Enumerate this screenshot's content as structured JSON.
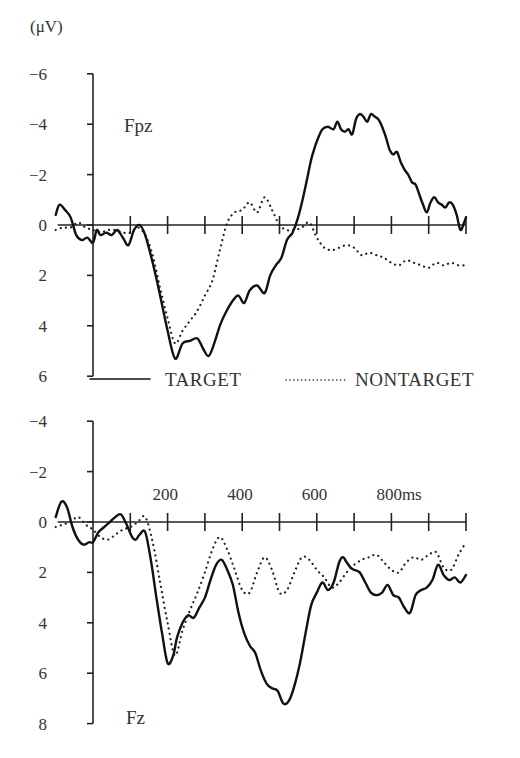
{
  "chart_data": [
    {
      "type": "line",
      "panel": "top",
      "unit_label": "(μV)",
      "channel": "Fpz",
      "xlabel": "",
      "ylabel": "(μV)",
      "x_unit": "ms",
      "xlim": [
        -100,
        1000
      ],
      "ylim": [
        -6,
        6
      ],
      "y_inverted": true,
      "yticks": [
        -6,
        -4,
        -2,
        0,
        2,
        4,
        6
      ],
      "ytick_labels": [
        "−6",
        "−4",
        "−2",
        "0",
        "2",
        "4",
        "6"
      ],
      "xticks": [
        0,
        100,
        200,
        300,
        400,
        500,
        600,
        700,
        800,
        900,
        1000
      ],
      "xtick_labels": [],
      "grid": false,
      "legend": "between-panels",
      "series": [
        {
          "name": "TARGET",
          "style": "solid",
          "x": [
            -100,
            -90,
            -75,
            -60,
            -45,
            -30,
            -15,
            0,
            10,
            20,
            35,
            50,
            65,
            80,
            95,
            110,
            125,
            140,
            160,
            180,
            200,
            220,
            240,
            260,
            280,
            295,
            310,
            325,
            340,
            355,
            375,
            390,
            405,
            420,
            440,
            460,
            475,
            490,
            505,
            520,
            535,
            550,
            565,
            575,
            585,
            595,
            605,
            615,
            630,
            645,
            655,
            665,
            675,
            685,
            695,
            705,
            715,
            725,
            735,
            745,
            755,
            765,
            775,
            785,
            795,
            805,
            815,
            825,
            835,
            845,
            855,
            865,
            875,
            885,
            895,
            905,
            915,
            925,
            935,
            945,
            955,
            965,
            975,
            985,
            995,
            1000
          ],
          "y": [
            -0.4,
            -0.8,
            -0.6,
            -0.3,
            0.4,
            0.6,
            0.5,
            0.7,
            0.2,
            0.4,
            0.3,
            0.4,
            0.2,
            0.5,
            0.8,
            0.2,
            0.0,
            0.4,
            1.5,
            2.8,
            4.2,
            5.3,
            4.7,
            4.6,
            4.5,
            4.9,
            5.2,
            4.7,
            4.0,
            3.5,
            3.0,
            2.8,
            3.1,
            2.6,
            2.4,
            2.7,
            2.0,
            1.6,
            1.3,
            0.6,
            0.3,
            -0.3,
            -1.2,
            -1.9,
            -2.6,
            -3.1,
            -3.5,
            -3.8,
            -3.9,
            -3.8,
            -4.1,
            -3.8,
            -3.7,
            -3.8,
            -3.6,
            -4.2,
            -4.4,
            -4.3,
            -4.1,
            -4.4,
            -4.3,
            -4.2,
            -3.9,
            -3.5,
            -3.0,
            -2.8,
            -2.9,
            -2.5,
            -2.2,
            -2.0,
            -1.7,
            -1.6,
            -1.2,
            -0.8,
            -0.5,
            -0.9,
            -1.1,
            -0.9,
            -0.8,
            -0.7,
            -0.9,
            -0.8,
            -0.4,
            0.2,
            -0.1,
            -0.3
          ]
        },
        {
          "name": "NONTARGET",
          "style": "dotted",
          "x": [
            -100,
            -80,
            -60,
            -40,
            -20,
            0,
            20,
            40,
            60,
            80,
            100,
            120,
            140,
            160,
            180,
            200,
            220,
            240,
            260,
            280,
            300,
            320,
            340,
            360,
            380,
            400,
            420,
            440,
            460,
            480,
            500,
            520,
            540,
            560,
            580,
            600,
            620,
            640,
            660,
            680,
            700,
            720,
            740,
            760,
            780,
            800,
            820,
            840,
            860,
            880,
            900,
            920,
            940,
            960,
            980,
            1000
          ],
          "y": [
            0.2,
            0.1,
            0.1,
            -0.1,
            0.1,
            0.2,
            0.3,
            0.2,
            0.2,
            0.3,
            0.3,
            0.1,
            0.4,
            1.2,
            2.5,
            3.7,
            4.7,
            4.2,
            3.8,
            3.4,
            2.8,
            2.2,
            1.0,
            -0.1,
            -0.5,
            -0.6,
            -0.9,
            -0.5,
            -1.1,
            -0.6,
            0.0,
            0.2,
            0.2,
            0.1,
            -0.1,
            0.5,
            0.9,
            1.0,
            0.9,
            0.8,
            0.9,
            1.2,
            1.1,
            1.2,
            1.3,
            1.5,
            1.6,
            1.4,
            1.5,
            1.6,
            1.7,
            1.5,
            1.6,
            1.5,
            1.6,
            1.6
          ]
        }
      ]
    },
    {
      "type": "line",
      "panel": "bottom",
      "channel": "Fz",
      "xlabel": "",
      "ylabel": "",
      "x_unit": "ms",
      "xlim": [
        -100,
        1000
      ],
      "ylim": [
        -4,
        8
      ],
      "y_inverted": true,
      "yticks": [
        -4,
        -2,
        0,
        2,
        4,
        6,
        8
      ],
      "ytick_labels": [
        "−4",
        "−2",
        "0",
        "2",
        "4",
        "6",
        "8"
      ],
      "xticks": [
        0,
        100,
        200,
        300,
        400,
        500,
        600,
        700,
        800,
        900,
        1000
      ],
      "xtick_labels": [
        "200",
        "400",
        "600",
        "800ms"
      ],
      "xtick_label_values": [
        200,
        400,
        600,
        800
      ],
      "grid": false,
      "series": [
        {
          "name": "TARGET",
          "style": "solid",
          "x": [
            -100,
            -85,
            -70,
            -55,
            -40,
            -25,
            -10,
            0,
            15,
            30,
            45,
            60,
            75,
            90,
            105,
            115,
            125,
            140,
            155,
            170,
            185,
            200,
            215,
            225,
            240,
            255,
            270,
            285,
            300,
            315,
            330,
            345,
            360,
            375,
            390,
            405,
            420,
            435,
            450,
            465,
            480,
            495,
            510,
            525,
            540,
            555,
            570,
            585,
            600,
            615,
            630,
            645,
            660,
            670,
            680,
            690,
            700,
            715,
            730,
            745,
            760,
            775,
            790,
            805,
            820,
            835,
            850,
            865,
            880,
            895,
            910,
            925,
            940,
            955,
            970,
            985,
            1000
          ],
          "y": [
            -0.2,
            -0.8,
            -0.6,
            0.2,
            0.7,
            0.9,
            0.8,
            0.8,
            0.4,
            0.2,
            0.0,
            -0.2,
            -0.3,
            0.1,
            0.6,
            0.7,
            0.5,
            0.4,
            1.5,
            3.0,
            4.4,
            5.6,
            5.3,
            4.6,
            4.0,
            3.7,
            3.8,
            3.4,
            3.0,
            2.3,
            1.7,
            1.5,
            1.9,
            2.5,
            3.6,
            4.4,
            4.9,
            5.2,
            5.9,
            6.4,
            6.6,
            6.7,
            7.2,
            7.1,
            6.5,
            5.6,
            4.4,
            3.3,
            2.8,
            2.4,
            2.7,
            2.4,
            1.6,
            1.4,
            1.6,
            1.8,
            1.9,
            2.0,
            2.4,
            2.8,
            2.9,
            2.8,
            2.5,
            2.9,
            3.0,
            3.4,
            3.6,
            2.9,
            2.7,
            2.6,
            2.3,
            1.7,
            2.1,
            2.3,
            2.2,
            2.4,
            2.1
          ]
        },
        {
          "name": "NONTARGET",
          "style": "dotted",
          "x": [
            -100,
            -80,
            -60,
            -40,
            -20,
            0,
            20,
            40,
            60,
            80,
            100,
            120,
            140,
            160,
            180,
            200,
            220,
            240,
            260,
            280,
            300,
            320,
            340,
            360,
            380,
            400,
            420,
            440,
            460,
            480,
            500,
            520,
            540,
            560,
            580,
            600,
            620,
            640,
            660,
            680,
            700,
            720,
            740,
            760,
            780,
            800,
            820,
            840,
            860,
            880,
            900,
            920,
            940,
            960,
            980,
            1000
          ],
          "y": [
            0.2,
            0.1,
            0.0,
            -0.2,
            0.1,
            0.3,
            0.6,
            0.7,
            0.5,
            0.3,
            0.2,
            0.0,
            -0.2,
            0.8,
            2.4,
            4.0,
            5.3,
            4.3,
            3.5,
            2.8,
            2.0,
            1.1,
            0.6,
            1.1,
            1.9,
            2.7,
            2.8,
            2.0,
            1.4,
            1.9,
            2.8,
            2.7,
            2.0,
            1.4,
            1.5,
            1.9,
            2.2,
            2.6,
            2.4,
            2.0,
            1.7,
            1.5,
            1.4,
            1.3,
            1.6,
            1.9,
            2.0,
            1.6,
            1.4,
            1.5,
            1.3,
            1.2,
            1.8,
            1.9,
            1.3,
            0.8
          ]
        }
      ]
    }
  ],
  "legend": {
    "items": [
      {
        "label": "TARGET",
        "style": "solid"
      },
      {
        "label": "NONTARGET",
        "style": "dotted"
      }
    ]
  }
}
